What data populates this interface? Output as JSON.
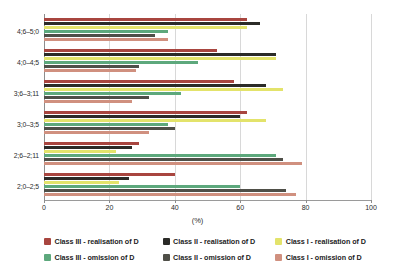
{
  "chart_data": {
    "type": "bar",
    "orientation": "horizontal",
    "title": "",
    "xlabel": "(%)",
    "ylabel": "",
    "xlim": [
      0,
      100
    ],
    "ylim": null,
    "grid": true,
    "legend_position": "bottom",
    "xticks": [
      0,
      20,
      40,
      60,
      80,
      100
    ],
    "xtick_labels": [
      "0",
      "20",
      "40",
      "60",
      "80",
      "100"
    ],
    "categories": [
      "2;0–2;5",
      "2;6–2;11",
      "3;0–3;5",
      "3;6–3;11",
      "4;0–4;5",
      "4;6–5;0"
    ],
    "categories_top_to_bottom": [
      "4;6–5;0",
      "4;0–4;5",
      "3;6–3;11",
      "3;0–3;5",
      "2;6–2;11",
      "2;0–2;5"
    ],
    "series": [
      {
        "name": "Class III – realisation of D",
        "color": "#a8453f",
        "values_top_to_bottom": [
          62,
          53,
          58,
          62,
          29,
          40
        ]
      },
      {
        "name": "Class II – realisation of D",
        "color": "#2b2b28",
        "values_top_to_bottom": [
          66,
          71,
          68,
          60,
          27,
          26
        ]
      },
      {
        "name": "Class I – realisation of D",
        "color": "#e3e36b",
        "values_top_to_bottom": [
          62,
          71,
          73,
          68,
          22,
          23
        ]
      },
      {
        "name": "Class III – omission of D",
        "color": "#5da87c",
        "values_top_to_bottom": [
          38,
          47,
          42,
          38,
          71,
          60
        ]
      },
      {
        "name": "Class II – omission of D",
        "color": "#4f4f48",
        "values_top_to_bottom": [
          34,
          29,
          32,
          40,
          73,
          74
        ]
      },
      {
        "name": "Class I – omission of D",
        "color": "#d0907f",
        "values_top_to_bottom": [
          38,
          28,
          27,
          32,
          79,
          77
        ]
      }
    ]
  },
  "axes": {
    "x_title": "(%)",
    "x_tick_labels": [
      "0",
      "20",
      "40",
      "60",
      "80",
      "100"
    ],
    "y_tick_labels": [
      "4;6–5;0",
      "4;0–4;5",
      "3;6–3;11",
      "3;0–3;5",
      "2;6–2;11",
      "2;0–2;5"
    ]
  },
  "legend": {
    "rows": [
      [
        {
          "label": "Class III -  realisation of D",
          "color": "#a8453f"
        },
        {
          "label": "Class II - realisation of D",
          "color": "#2b2b28"
        },
        {
          "label": "Class I -  realisation of D",
          "color": "#e3e36b"
        }
      ],
      [
        {
          "label": "Class III -  omission of D",
          "color": "#5da87c"
        },
        {
          "label": "Class II - omission of D",
          "color": "#4f4f48"
        },
        {
          "label": "Class I -  omission of D",
          "color": "#d0907f"
        }
      ]
    ]
  },
  "colors": {
    "grid": "#d8d8d8",
    "axis": "#8d8d8d",
    "text": "#2b2b2b",
    "background": "#ffffff"
  }
}
